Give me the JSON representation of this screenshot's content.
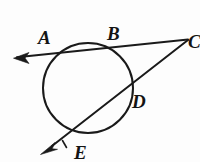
{
  "figure": {
    "kind": "geometry-diagram",
    "background_color": "#fdfdfd",
    "stroke_color": "#1a1a1a",
    "label_color": "#141414"
  },
  "circle": {
    "name": "main-circle",
    "center_x": 88,
    "center_y": 88,
    "radius": 45,
    "stroke_width": 2.0
  },
  "labels": {
    "a": "A",
    "b": "B",
    "c": "C",
    "d": "D",
    "e": "E"
  },
  "label_positions": {
    "a": {
      "x": 38,
      "y": 44
    },
    "b": {
      "x": 107,
      "y": 40
    },
    "c": {
      "x": 188,
      "y": 48
    },
    "d": {
      "x": 132,
      "y": 108
    },
    "e": {
      "x": 74,
      "y": 159
    }
  },
  "points": {
    "A": {
      "x": 55,
      "y": 53,
      "on_circle": true
    },
    "B": {
      "x": 110,
      "y": 47,
      "on_circle": true
    },
    "C": {
      "x": 188,
      "y": 39,
      "on_circle": false,
      "external": true
    },
    "D": {
      "x": 127,
      "y": 87,
      "on_circle": true
    },
    "E": {
      "x": 71,
      "y": 131,
      "on_circle": true
    }
  },
  "lines": [
    {
      "name": "secant-abc",
      "from": "arrow-left",
      "through": [
        "A",
        "B"
      ],
      "to": "C",
      "x1": 16,
      "y1": 57,
      "x2": 188,
      "y2": 39,
      "stroke_width": 2.0,
      "has_arrow_start": true,
      "has_arrow_end": false
    },
    {
      "name": "secant-edc",
      "from": "arrow-lower-left",
      "through": [
        "E",
        "D"
      ],
      "to": "C",
      "x1": 51,
      "y1": 147,
      "x2": 188,
      "y2": 40,
      "stroke_width": 2.0,
      "has_arrow_start": true,
      "has_arrow_end": false
    },
    {
      "name": "segment-bc",
      "from": "C",
      "to": "B",
      "x1": 188,
      "y1": 40,
      "x2": 110,
      "y2": 47,
      "stroke_width": 2.0
    }
  ],
  "arrows": [
    {
      "name": "arrow-left",
      "tip_x": 14,
      "tip_y": 58,
      "direction": "left",
      "angle_deg": 186
    },
    {
      "name": "arrow-lower-left",
      "tip_x": 41,
      "tip_y": 154,
      "direction": "down-left",
      "angle_deg": 142
    }
  ],
  "tick_mark": {
    "name": "e-tick-mark",
    "x1": 62,
    "y1": 141,
    "x2": 66,
    "y2": 147
  }
}
